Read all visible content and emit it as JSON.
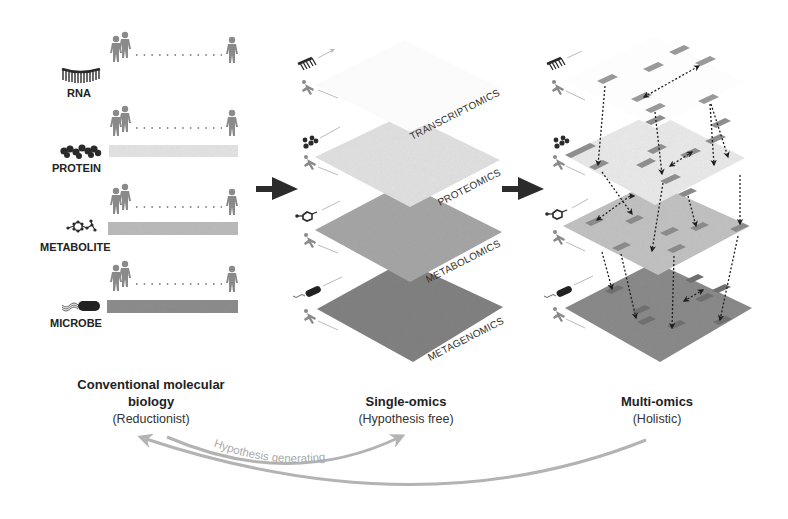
{
  "left_panel": {
    "rows": [
      {
        "label": "RNA",
        "icon": "rna-icon",
        "bar_color": null
      },
      {
        "label": "PROTEIN",
        "icon": "protein-icon",
        "bar_color": "#e6e6e6"
      },
      {
        "label": "METABOLITE",
        "icon": "metabolite-icon",
        "bar_color": "#bdbdbd"
      },
      {
        "label": "MICROBE",
        "icon": "microbe-icon",
        "bar_color": "#8f8f8f"
      }
    ]
  },
  "middle_panel": {
    "planes": [
      {
        "label": "TRANSCRIPTOMICS",
        "color": "#fbfbfb"
      },
      {
        "label": "PROTEOMICS",
        "color": "#e3e3e3"
      },
      {
        "label": "METABOLOMICS",
        "color": "#a8a8a8"
      },
      {
        "label": "METAGENOMICS",
        "color": "#838383"
      }
    ]
  },
  "right_panel": {
    "planes": [
      {
        "color": "#fdfdfd"
      },
      {
        "color": "#ececec"
      },
      {
        "color": "#c4c4c4"
      },
      {
        "color": "#8c8c8c"
      }
    ]
  },
  "captions": {
    "conventional": {
      "title_line1": "Conventional molecular",
      "title_line2": "biology",
      "subtitle": "(Reductionist)"
    },
    "single": {
      "title": "Single-omics",
      "subtitle": "(Hypothesis free)"
    },
    "multi": {
      "title": "Multi-omics",
      "subtitle": "(Holistic)"
    }
  },
  "cycle": {
    "label": "Hypothesis generating",
    "arrow_color": "#b3b3b3"
  },
  "colors": {
    "person": "#8a8a8a",
    "arrow": "#2b2b2b",
    "icon": "#2a2a2a"
  }
}
